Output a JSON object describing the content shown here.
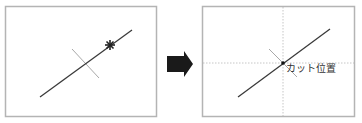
{
  "before_panel": {
    "name": "before",
    "marker": "star-marker"
  },
  "arrow": {
    "label": "",
    "color": "#1a1a1a"
  },
  "after_panel": {
    "name": "after",
    "cut_label": "カット位置"
  },
  "colors": {
    "main_line": "#3a3a3a",
    "perpendicular": "#a8a8a8",
    "guides": "#b8b8b8",
    "frame": "#b4b4b4"
  }
}
